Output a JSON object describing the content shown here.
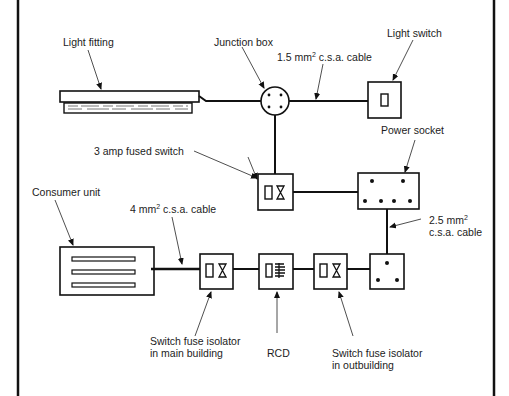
{
  "diagram": {
    "type": "electrical wiring schematic",
    "components": [
      {
        "id": "light_fitting",
        "label": "Light fitting"
      },
      {
        "id": "junction_box",
        "label": "Junction box"
      },
      {
        "id": "light_switch",
        "label": "Light switch"
      },
      {
        "id": "fused_switch",
        "label": "3 amp fused switch"
      },
      {
        "id": "power_socket",
        "label": "Power socket"
      },
      {
        "id": "consumer_unit",
        "label": "Consumer unit"
      },
      {
        "id": "sfi_main",
        "label_line1": "Switch fuse isolator",
        "label_line2": "in main building"
      },
      {
        "id": "rcd",
        "label": "RCD"
      },
      {
        "id": "sfi_out",
        "label_line1": "Switch fuse isolator",
        "label_line2": "in outbuilding"
      }
    ],
    "cables": {
      "c15": {
        "size": "1.5 mm",
        "sup": "2",
        "rest": " c.s.a. cable"
      },
      "c4": {
        "size": "4 mm",
        "sup": "2",
        "rest": " c.s.a. cable"
      },
      "c25": {
        "size": "2.5 mm",
        "sup": "2",
        "line2": "c.s.a. cable"
      }
    }
  }
}
